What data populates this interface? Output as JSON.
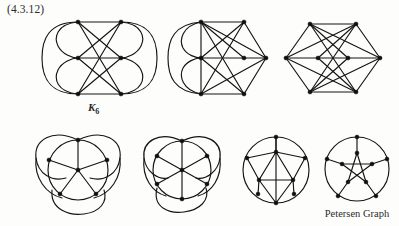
{
  "document": {
    "exercise_label": "(4.3.12)",
    "background_color": "#fdfdfc",
    "ink_color": "#141414"
  },
  "captions": {
    "k6_text": "K",
    "k6_subscript": "6",
    "petersen": "Petersen Graph"
  },
  "figures": [
    {
      "id": "k6-grid-embedding",
      "name": "K6 drawn on a 2x3 vertex grid with side arcs",
      "graph": "K6",
      "vertices": 6,
      "edges": 15,
      "style": "mixed straight edges and circular arcs"
    },
    {
      "id": "k6-hexagon-arcs",
      "name": "K6 drawn with left-side nested arcs and right-side straight edges",
      "graph": "K6",
      "vertices": 6,
      "edges": 15,
      "style": "mixed straight edges and circular arcs"
    },
    {
      "id": "k6-hexagon-straight",
      "name": "K6 drawn as a hexagon with all straight chords",
      "graph": "K6",
      "vertices": 6,
      "edges": 15,
      "style": "straight-line drawing"
    },
    {
      "id": "wheel-w5-arcs",
      "name": "Wheel W5 with three outer lobes",
      "graph": "W5",
      "vertices": 6,
      "edges": 10,
      "style": "mixed straight spokes and outer arcs"
    },
    {
      "id": "wheel-w6-arcs",
      "name": "Wheel W6 with three outer lobes",
      "graph": "W6",
      "vertices": 7,
      "edges": 12,
      "style": "mixed straight spokes and outer arcs"
    },
    {
      "id": "circle-triangle-graph",
      "name": "Outer 5-cycle with inner triangle and connecting spokes",
      "graph": "Petersen-like reduction",
      "vertices": 8,
      "edges": 13,
      "style": "straight-line drawing"
    },
    {
      "id": "petersen-graph",
      "name": "Petersen graph: outer circle, inner pentagram, five spokes",
      "graph": "Petersen",
      "vertices": 10,
      "edges": 15,
      "style": "standard pentagon-pentagram drawing"
    }
  ]
}
